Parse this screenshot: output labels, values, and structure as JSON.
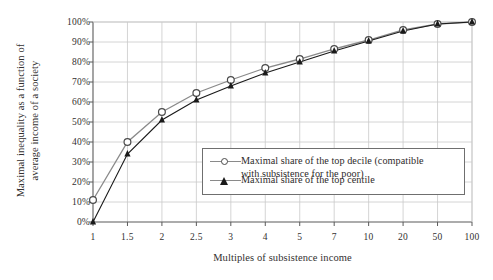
{
  "chart_data": {
    "type": "line",
    "title": "",
    "xlabel": "Multiples of subsistence income",
    "ylabel": "Maximal inequality as a function of average income of a society",
    "ylabel_line1": "Maximal inequality as a function of",
    "ylabel_line2": "average income of a society",
    "categories": [
      "1",
      "1.5",
      "2",
      "2.5",
      "3",
      "4",
      "5",
      "7",
      "10",
      "20",
      "50",
      "100"
    ],
    "ylim": [
      0,
      100
    ],
    "yticks": [
      0,
      10,
      20,
      30,
      40,
      50,
      60,
      70,
      80,
      90,
      100
    ],
    "ytick_labels": [
      "0%",
      "10%",
      "20%",
      "30%",
      "40%",
      "50%",
      "60%",
      "70%",
      "80%",
      "90%",
      "100%"
    ],
    "grid": true,
    "legend_position": "inside-lower-center-right",
    "series": [
      {
        "name": "Maximal share of the top decile (compatible with subsistence for the poor)",
        "name_line1": "Maximal share of the top decile (compatible",
        "name_line2": "with subsistence for the poor)",
        "marker": "open-circle",
        "color": "#8a8a8a",
        "values": [
          11,
          40,
          55,
          64.5,
          71,
          77,
          81.5,
          86.5,
          91,
          96,
          99,
          100
        ]
      },
      {
        "name": "Maximal share of the top centile",
        "name_line1": "Maximal share of the top centile",
        "name_line2": "",
        "marker": "filled-triangle",
        "color": "#1a1a1a",
        "values": [
          0,
          34,
          51,
          61,
          68,
          74.5,
          80,
          85.5,
          90.5,
          95.5,
          99,
          100
        ]
      }
    ]
  },
  "colors": {
    "background": "#ffffff",
    "axis": "#5a5a5a",
    "grid": "#c9c9c9",
    "text": "#333030",
    "series_decile": "#8a8a8a",
    "series_centile": "#1a1a1a"
  }
}
